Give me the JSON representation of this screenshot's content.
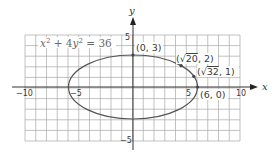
{
  "chart_data": {
    "type": "line",
    "title": "",
    "equation": "x² + 4y² = 36",
    "xlabel": "x",
    "ylabel": "y",
    "xlim": [
      -10,
      10
    ],
    "ylim": [
      -5,
      5
    ],
    "grid": true,
    "grid_step": 1,
    "x_tick_labels": [
      "−10",
      "−5",
      "5",
      "10"
    ],
    "y_tick_labels": [
      "5",
      "−5"
    ],
    "curve": {
      "kind": "ellipse",
      "center": [
        0,
        0
      ],
      "semi_major_x": 6,
      "semi_minor_y": 3,
      "color": "#555555"
    },
    "points": [
      {
        "x": 0,
        "y": 3,
        "label": "(0, 3)"
      },
      {
        "x": 4.472,
        "y": 2,
        "label": "(√20, 2)"
      },
      {
        "x": 5.657,
        "y": 1,
        "label": "(√32, 1)"
      },
      {
        "x": 6,
        "y": 0,
        "label": "(6, 0)"
      }
    ],
    "colors": {
      "grid": "#9a9a9a",
      "axis": "#333333",
      "curve": "#555555",
      "point": "#444444"
    }
  },
  "labels": {
    "equation": "x² + 4y² = 36",
    "x_axis": "x",
    "y_axis": "y",
    "tick_x_neg10": "−10",
    "tick_x_neg5": "−5",
    "tick_x_5": "5",
    "tick_x_10": "10",
    "tick_y_5": "5",
    "tick_y_neg5": "−5",
    "pt_0_3": "(0, 3)",
    "pt_sqrt20_2_open": "(",
    "pt_sqrt20_2_rad": "20",
    "pt_sqrt20_2_close": ", 2)",
    "pt_sqrt32_1_open": "(",
    "pt_sqrt32_1_rad": "32",
    "pt_sqrt32_1_close": ", 1)",
    "pt_6_0": "(6, 0)"
  }
}
